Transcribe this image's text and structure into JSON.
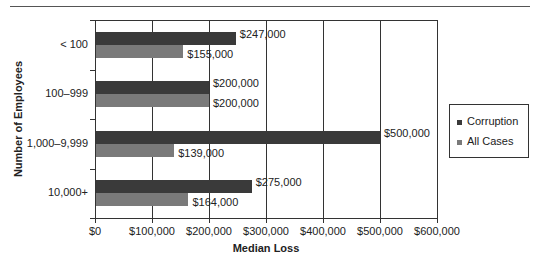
{
  "chart_data": {
    "type": "bar",
    "orientation": "horizontal",
    "title": "",
    "xlabel": "Median Loss",
    "ylabel": "Number of Employees",
    "categories": [
      "< 100",
      "100–999",
      "1,000–9,999",
      "10,000+"
    ],
    "series": [
      {
        "name": "Corruption",
        "color": "#3a3a3a",
        "values": [
          247000,
          200000,
          500000,
          275000
        ],
        "labels": [
          "$247,000",
          "$200,000",
          "$500,000",
          "$275,000"
        ]
      },
      {
        "name": "All Cases",
        "color": "#7a7a7a",
        "values": [
          155000,
          200000,
          139000,
          164000
        ],
        "labels": [
          "$155,000",
          "$200,000",
          "$139,000",
          "$164,000"
        ]
      }
    ],
    "xlim": [
      0,
      600000
    ],
    "x_ticks": [
      "$0",
      "$100,000",
      "$200,000",
      "$300,000",
      "$400,000",
      "$500,000",
      "$600,000"
    ],
    "grid": "vertical",
    "legend_position": "right"
  },
  "legend": {
    "items": [
      "Corruption",
      "All Cases"
    ]
  },
  "axes": {
    "xlabel": "Median Loss",
    "ylabel": "Number of Employees"
  }
}
